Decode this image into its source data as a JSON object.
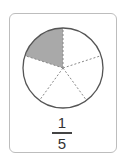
{
  "diagram": {
    "type": "fraction-pie",
    "total_parts": 5,
    "shaded_parts": 1,
    "colors": {
      "shaded": "#a9a9a9",
      "outline": "#555555",
      "divider": "#888888",
      "card_border": "#bdbdbd"
    }
  },
  "fraction": {
    "numerator": "1",
    "denominator": "5"
  }
}
